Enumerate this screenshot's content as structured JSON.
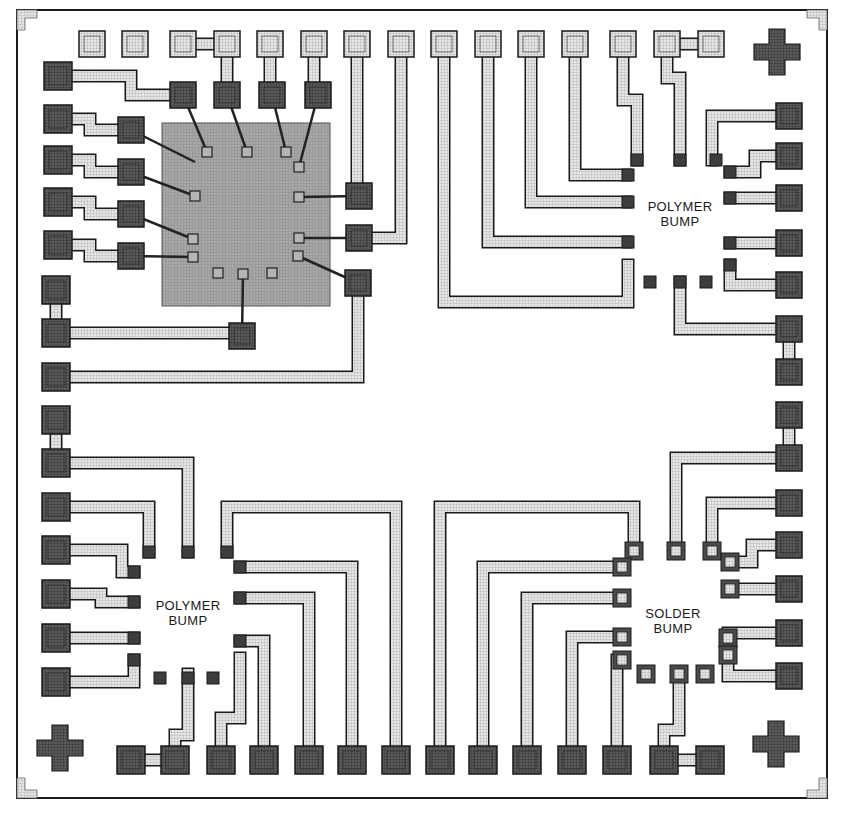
{
  "figure": {
    "type": "substrate-layout",
    "labels": [
      {
        "id": "polymer-bump-top-right",
        "line1": "POLYMER",
        "line2": "BUMP",
        "x": 678,
        "y": 199
      },
      {
        "id": "polymer-bump-bottom-left",
        "line1": "POLYMER",
        "line2": "BUMP",
        "x": 187,
        "y": 606
      },
      {
        "id": "solder-bump-bottom-right",
        "line1": "SOLDER",
        "line2": "BUMP",
        "x": 673,
        "y": 613
      }
    ],
    "colors": {
      "outline": "#1a1a1a",
      "trace_fill": "#d8d8d8",
      "pad_dark": "#3a3a3a",
      "pad_light": "#bdbdbd",
      "chip": "#9a9a9a",
      "background": "#ffffff"
    },
    "border": {
      "x": 17,
      "y": 10,
      "w": 810,
      "h": 788
    },
    "chip": {
      "x": 162,
      "y": 123,
      "w": 168,
      "h": 183
    },
    "chip_pads": [
      [
        207,
        152
      ],
      [
        247,
        152
      ],
      [
        286,
        152
      ],
      [
        299,
        167
      ],
      [
        195,
        196
      ],
      [
        299,
        197
      ],
      [
        193,
        239
      ],
      [
        299,
        238
      ],
      [
        193,
        257
      ],
      [
        298,
        256
      ],
      [
        218,
        273
      ],
      [
        243,
        274
      ],
      [
        272,
        273
      ]
    ],
    "pads_top_light": [
      [
        92,
        44
      ],
      [
        135,
        44
      ],
      [
        183,
        44
      ],
      [
        227,
        44
      ],
      [
        270,
        44
      ],
      [
        314,
        44
      ],
      [
        357,
        44
      ],
      [
        401,
        44
      ],
      [
        444,
        44
      ],
      [
        488,
        44
      ],
      [
        531,
        44
      ],
      [
        575,
        44
      ],
      [
        623,
        44
      ],
      [
        667,
        44
      ],
      [
        711,
        44
      ]
    ],
    "pads_left_dark": [
      [
        58,
        76
      ],
      [
        58,
        119
      ],
      [
        58,
        160
      ],
      [
        58,
        202
      ],
      [
        58,
        245
      ],
      [
        56,
        290
      ],
      [
        56,
        333
      ],
      [
        56,
        377
      ],
      [
        56,
        420
      ],
      [
        56,
        463
      ],
      [
        56,
        507
      ],
      [
        56,
        550
      ],
      [
        56,
        594
      ],
      [
        56,
        638
      ],
      [
        56,
        682
      ]
    ],
    "pads_bottom_dark": [
      [
        131,
        760
      ],
      [
        175,
        760
      ],
      [
        221,
        760
      ],
      [
        264,
        760
      ],
      [
        309,
        760
      ],
      [
        352,
        760
      ],
      [
        396,
        760
      ],
      [
        440,
        760
      ],
      [
        483,
        760
      ],
      [
        527,
        760
      ],
      [
        572,
        760
      ],
      [
        617,
        760
      ],
      [
        664,
        760
      ],
      [
        710,
        760
      ]
    ],
    "pads_right_dark": [
      [
        789,
        116
      ],
      [
        789,
        156
      ],
      [
        789,
        198
      ],
      [
        789,
        243
      ],
      [
        789,
        285
      ],
      [
        789,
        329
      ],
      [
        789,
        372
      ],
      [
        789,
        415
      ],
      [
        789,
        458
      ],
      [
        789,
        503
      ],
      [
        789,
        545
      ],
      [
        789,
        589
      ],
      [
        789,
        633
      ],
      [
        789,
        676
      ]
    ],
    "pads_inner_medium": [
      [
        131,
        130
      ],
      [
        131,
        172
      ],
      [
        131,
        214
      ],
      [
        131,
        256
      ],
      [
        183,
        95
      ],
      [
        227,
        95
      ],
      [
        272,
        95
      ],
      [
        318,
        95
      ],
      [
        359,
        196
      ],
      [
        359,
        238
      ],
      [
        358,
        283
      ],
      [
        242,
        336
      ]
    ],
    "traces": [
      {
        "pts": [
          [
            58,
            76
          ],
          [
            131,
            76
          ],
          [
            131,
            95
          ],
          [
            183,
            95
          ]
        ]
      },
      {
        "pts": [
          [
            58,
            119
          ],
          [
            90,
            119
          ],
          [
            90,
            130
          ],
          [
            131,
            130
          ]
        ]
      },
      {
        "pts": [
          [
            58,
            160
          ],
          [
            90,
            160
          ],
          [
            90,
            172
          ],
          [
            131,
            172
          ]
        ]
      },
      {
        "pts": [
          [
            58,
            202
          ],
          [
            90,
            202
          ],
          [
            90,
            214
          ],
          [
            131,
            214
          ]
        ]
      },
      {
        "pts": [
          [
            58,
            245
          ],
          [
            90,
            245
          ],
          [
            90,
            256
          ],
          [
            131,
            256
          ]
        ]
      },
      {
        "pts": [
          [
            227,
            44
          ],
          [
            183,
            44
          ]
        ]
      },
      {
        "pts": [
          [
            227,
            44
          ],
          [
            227,
            95
          ]
        ]
      },
      {
        "pts": [
          [
            270,
            44
          ],
          [
            270,
            95
          ]
        ]
      },
      {
        "pts": [
          [
            314,
            44
          ],
          [
            314,
            95
          ]
        ]
      },
      {
        "pts": [
          [
            357,
            44
          ],
          [
            357,
            196
          ]
        ]
      },
      {
        "pts": [
          [
            401,
            44
          ],
          [
            401,
            238
          ],
          [
            359,
            238
          ]
        ]
      },
      {
        "pts": [
          [
            56,
            290
          ],
          [
            56,
            333
          ],
          [
            242,
            333
          ]
        ]
      },
      {
        "pts": [
          [
            56,
            377
          ],
          [
            358,
            377
          ],
          [
            358,
            283
          ]
        ]
      },
      {
        "pts": [
          [
            444,
            44
          ],
          [
            444,
            302
          ],
          [
            628,
            302
          ],
          [
            628,
            265
          ]
        ]
      },
      {
        "pts": [
          [
            488,
            44
          ],
          [
            488,
            242
          ],
          [
            626,
            242
          ]
        ]
      },
      {
        "pts": [
          [
            531,
            44
          ],
          [
            531,
            202
          ],
          [
            626,
            202
          ]
        ]
      },
      {
        "pts": [
          [
            575,
            44
          ],
          [
            575,
            175
          ],
          [
            626,
            175
          ]
        ]
      },
      {
        "pts": [
          [
            623,
            44
          ],
          [
            623,
            100
          ],
          [
            637,
            100
          ],
          [
            637,
            160
          ]
        ]
      },
      {
        "pts": [
          [
            667,
            44
          ],
          [
            711,
            44
          ]
        ]
      },
      {
        "pts": [
          [
            667,
            44
          ],
          [
            667,
            78
          ],
          [
            680,
            78
          ],
          [
            680,
            160
          ]
        ]
      },
      {
        "pts": [
          [
            789,
            116
          ],
          [
            712,
            116
          ],
          [
            712,
            160
          ]
        ]
      },
      {
        "pts": [
          [
            789,
            156
          ],
          [
            755,
            156
          ],
          [
            755,
            172
          ],
          [
            730,
            172
          ]
        ]
      },
      {
        "pts": [
          [
            789,
            198
          ],
          [
            730,
            198
          ]
        ]
      },
      {
        "pts": [
          [
            789,
            243
          ],
          [
            730,
            243
          ]
        ]
      },
      {
        "pts": [
          [
            789,
            285
          ],
          [
            730,
            285
          ],
          [
            730,
            265
          ]
        ]
      },
      {
        "pts": [
          [
            789,
            329
          ],
          [
            680,
            329
          ],
          [
            680,
            282
          ]
        ]
      },
      {
        "pts": [
          [
            789,
            329
          ],
          [
            789,
            372
          ]
        ]
      },
      {
        "pts": [
          [
            789,
            415
          ],
          [
            789,
            458
          ]
        ]
      },
      {
        "pts": [
          [
            789,
            458
          ],
          [
            676,
            458
          ],
          [
            676,
            551
          ]
        ]
      },
      {
        "pts": [
          [
            789,
            503
          ],
          [
            712,
            503
          ],
          [
            712,
            551
          ]
        ]
      },
      {
        "pts": [
          [
            789,
            545
          ],
          [
            752,
            545
          ],
          [
            752,
            562
          ],
          [
            730,
            562
          ]
        ]
      },
      {
        "pts": [
          [
            789,
            589
          ],
          [
            730,
            589
          ]
        ]
      },
      {
        "pts": [
          [
            789,
            633
          ],
          [
            728,
            633
          ],
          [
            728,
            676
          ],
          [
            789,
            676
          ]
        ]
      },
      {
        "pts": [
          [
            56,
            420
          ],
          [
            56,
            463
          ]
        ]
      },
      {
        "pts": [
          [
            56,
            463
          ],
          [
            188,
            463
          ],
          [
            188,
            552
          ]
        ]
      },
      {
        "pts": [
          [
            56,
            507
          ],
          [
            149,
            507
          ],
          [
            149,
            552
          ]
        ]
      },
      {
        "pts": [
          [
            56,
            550
          ],
          [
            122,
            550
          ],
          [
            122,
            572
          ],
          [
            134,
            572
          ]
        ]
      },
      {
        "pts": [
          [
            56,
            594
          ],
          [
            101,
            594
          ],
          [
            101,
            602
          ],
          [
            134,
            602
          ]
        ]
      },
      {
        "pts": [
          [
            56,
            638
          ],
          [
            134,
            638
          ]
        ]
      },
      {
        "pts": [
          [
            56,
            682
          ],
          [
            134,
            682
          ],
          [
            134,
            660
          ]
        ]
      },
      {
        "pts": [
          [
            131,
            760
          ],
          [
            175,
            760
          ]
        ]
      },
      {
        "pts": [
          [
            175,
            760
          ],
          [
            175,
            735
          ],
          [
            188,
            735
          ],
          [
            188,
            674
          ]
        ]
      },
      {
        "pts": [
          [
            221,
            760
          ],
          [
            221,
            718
          ],
          [
            240,
            718
          ],
          [
            240,
            658
          ]
        ]
      },
      {
        "pts": [
          [
            264,
            760
          ],
          [
            264,
            641
          ],
          [
            240,
            641
          ]
        ]
      },
      {
        "pts": [
          [
            309,
            760
          ],
          [
            309,
            598
          ],
          [
            240,
            598
          ]
        ]
      },
      {
        "pts": [
          [
            352,
            760
          ],
          [
            352,
            567
          ],
          [
            240,
            567
          ]
        ]
      },
      {
        "pts": [
          [
            396,
            760
          ],
          [
            396,
            507
          ],
          [
            227,
            507
          ],
          [
            227,
            552
          ]
        ]
      },
      {
        "pts": [
          [
            440,
            760
          ],
          [
            440,
            507
          ],
          [
            634,
            507
          ],
          [
            634,
            551
          ]
        ]
      },
      {
        "pts": [
          [
            483,
            760
          ],
          [
            483,
            567
          ],
          [
            622,
            567
          ]
        ]
      },
      {
        "pts": [
          [
            527,
            760
          ],
          [
            527,
            598
          ],
          [
            622,
            598
          ]
        ]
      },
      {
        "pts": [
          [
            572,
            760
          ],
          [
            572,
            637
          ],
          [
            622,
            637
          ]
        ]
      },
      {
        "pts": [
          [
            617,
            760
          ],
          [
            617,
            660
          ]
        ]
      },
      {
        "pts": [
          [
            664,
            760
          ],
          [
            710,
            760
          ]
        ]
      },
      {
        "pts": [
          [
            664,
            760
          ],
          [
            664,
            730
          ],
          [
            679,
            730
          ],
          [
            679,
            674
          ]
        ]
      }
    ],
    "bumps_small_dark": [
      [
        628,
        242
      ],
      [
        628,
        202
      ],
      [
        628,
        175
      ],
      [
        637,
        160
      ],
      [
        680,
        160
      ],
      [
        716,
        160
      ],
      [
        730,
        172
      ],
      [
        730,
        198
      ],
      [
        730,
        243
      ],
      [
        730,
        265
      ],
      [
        650,
        282
      ],
      [
        680,
        282
      ],
      [
        706,
        282
      ],
      [
        134,
        572
      ],
      [
        134,
        602
      ],
      [
        134,
        638
      ],
      [
        134,
        660
      ],
      [
        160,
        678
      ],
      [
        188,
        678
      ],
      [
        213,
        678
      ],
      [
        240,
        641
      ],
      [
        240,
        598
      ],
      [
        240,
        567
      ],
      [
        188,
        552
      ],
      [
        149,
        552
      ],
      [
        227,
        552
      ]
    ],
    "bumps_small_framed": [
      [
        634,
        551
      ],
      [
        676,
        551
      ],
      [
        712,
        551
      ],
      [
        730,
        562
      ],
      [
        622,
        567
      ],
      [
        622,
        598
      ],
      [
        622,
        637
      ],
      [
        622,
        660
      ],
      [
        646,
        674
      ],
      [
        679,
        674
      ],
      [
        705,
        674
      ],
      [
        730,
        589
      ],
      [
        728,
        638
      ],
      [
        728,
        655
      ]
    ],
    "alignment_crosses": [
      [
        777,
        52
      ],
      [
        60,
        748
      ],
      [
        776,
        744
      ]
    ],
    "corner_marks": [
      {
        "x": 17,
        "y": 10,
        "corner": "tl"
      },
      {
        "x": 827,
        "y": 10,
        "corner": "tr"
      },
      {
        "x": 17,
        "y": 798,
        "corner": "bl"
      },
      {
        "x": 827,
        "y": 798,
        "corner": "br"
      }
    ]
  }
}
